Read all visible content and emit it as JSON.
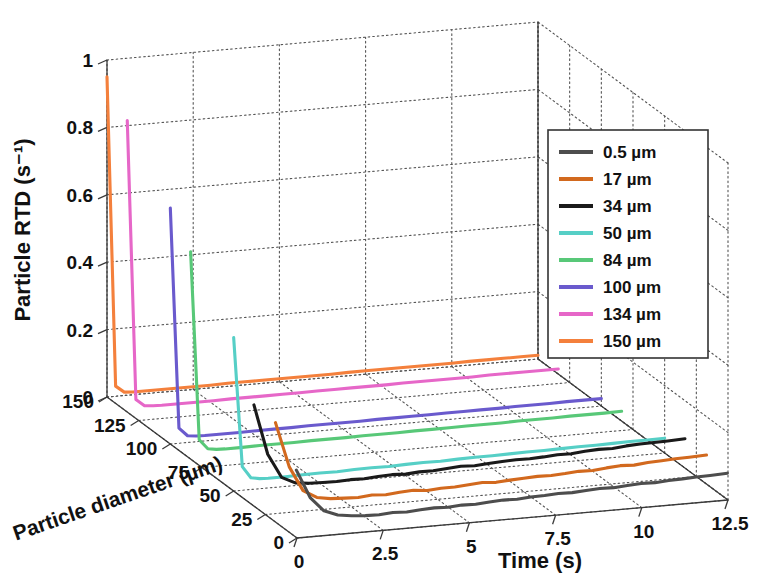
{
  "chart_data": {
    "type": "line",
    "projection": "3d",
    "title": "",
    "xlabel": "Time (s)",
    "ylabel": "Particle diameter (µm)",
    "zlabel": "Particle RTD (s⁻¹)",
    "xlim": [
      0,
      12.5
    ],
    "ylim": [
      0,
      150
    ],
    "zlim": [
      0,
      1
    ],
    "xticks": [
      "0",
      "2.5",
      "5",
      "7.5",
      "10",
      "12.5"
    ],
    "xtick_values": [
      0,
      2.5,
      5,
      7.5,
      10,
      12.5
    ],
    "yticks": [
      "0",
      "25",
      "50",
      "75",
      "100",
      "125",
      "150"
    ],
    "ytick_values": [
      0,
      25,
      50,
      75,
      100,
      125,
      150
    ],
    "zticks": [
      "0",
      "0.2",
      "0.4",
      "0.6",
      "0.8",
      "1"
    ],
    "ztick_values": [
      0,
      0.2,
      0.4,
      0.6,
      0.8,
      1
    ],
    "grid": true,
    "grid_style": "dotted",
    "legend_position": "upper-right",
    "legend_title": "",
    "series": [
      {
        "name": "0.5 µm",
        "diameter": 0.5,
        "color": "#4d4d4d",
        "x": [
          0,
          0.4,
          0.8,
          1.2,
          1.6,
          2,
          2.4,
          2.8,
          3.2,
          3.6,
          4,
          4.4,
          4.8,
          5.2,
          5.6,
          6,
          6.4,
          6.8,
          7.2,
          7.6,
          8,
          8.4,
          8.8,
          9.2,
          9.6,
          10,
          10.4,
          10.8,
          11.2,
          11.6,
          12,
          12.5
        ],
        "values": [
          0.2,
          0.115,
          0.072,
          0.056,
          0.05,
          0.047,
          0.046,
          0.049,
          0.047,
          0.05,
          0.052,
          0.05,
          0.053,
          0.052,
          0.055,
          0.057,
          0.056,
          0.059,
          0.06,
          0.062,
          0.061,
          0.064,
          0.066,
          0.065,
          0.068,
          0.07,
          0.069,
          0.072,
          0.073,
          0.075,
          0.076,
          0.078
        ]
      },
      {
        "name": "17 µm",
        "diameter": 17,
        "color": "#d2691e",
        "x": [
          0,
          0.4,
          0.8,
          1.2,
          1.6,
          2,
          2.4,
          2.8,
          3.2,
          3.6,
          4,
          4.4,
          4.8,
          5.2,
          5.6,
          6,
          6.4,
          6.8,
          7.2,
          7.6,
          8,
          8.4,
          8.8,
          9.2,
          9.6,
          10,
          10.4,
          10.8,
          11.2,
          11.6,
          12,
          12.5
        ],
        "values": [
          0.295,
          0.16,
          0.086,
          0.062,
          0.055,
          0.053,
          0.051,
          0.055,
          0.052,
          0.056,
          0.058,
          0.054,
          0.057,
          0.057,
          0.06,
          0.063,
          0.06,
          0.063,
          0.065,
          0.067,
          0.066,
          0.068,
          0.071,
          0.07,
          0.074,
          0.077,
          0.075,
          0.079,
          0.081,
          0.083,
          0.084,
          0.086
        ]
      },
      {
        "name": "34 µm",
        "diameter": 34,
        "color": "#1a1a1a",
        "x": [
          0,
          0.4,
          0.8,
          1.2,
          1.6,
          2,
          2.4,
          2.8,
          3.2,
          3.6,
          4,
          4.4,
          4.8,
          5.2,
          5.6,
          6,
          6.4,
          6.8,
          7.2,
          7.6,
          8,
          8.4,
          8.8,
          9.2,
          9.6,
          10,
          10.4,
          10.8,
          11.2,
          11.6,
          12,
          12.5
        ],
        "values": [
          0.3,
          0.15,
          0.078,
          0.058,
          0.053,
          0.052,
          0.051,
          0.053,
          0.052,
          0.055,
          0.057,
          0.055,
          0.058,
          0.058,
          0.061,
          0.064,
          0.062,
          0.065,
          0.067,
          0.069,
          0.068,
          0.07,
          0.073,
          0.072,
          0.076,
          0.078,
          0.077,
          0.081,
          0.083,
          0.084,
          0.085,
          0.087
        ]
      },
      {
        "name": "50 µm",
        "diameter": 50,
        "color": "#56cfc6",
        "x": [
          0,
          0.25,
          0.5,
          0.75,
          1,
          1.5,
          2,
          2.5,
          3,
          3.5,
          4,
          4.5,
          5,
          5.5,
          6,
          6.5,
          7,
          7.5,
          8,
          8.5,
          9,
          9.5,
          10,
          10.5,
          11,
          11.5,
          12,
          12.5
        ],
        "values": [
          0.455,
          0.07,
          0.035,
          0.03,
          0.029,
          0.029,
          0.03,
          0.031,
          0.03,
          0.032,
          0.033,
          0.032,
          0.034,
          0.035,
          0.034,
          0.036,
          0.037,
          0.037,
          0.038,
          0.039,
          0.039,
          0.04,
          0.041,
          0.041,
          0.042,
          0.043,
          0.043,
          0.044
        ]
      },
      {
        "name": "84 µm",
        "diameter": 84,
        "color": "#58c878",
        "x": [
          0,
          0.25,
          0.5,
          0.75,
          1,
          1.5,
          2,
          2.5,
          3,
          3.5,
          4,
          4.5,
          5,
          5.5,
          6,
          6.5,
          7,
          7.5,
          8,
          8.5,
          9,
          9.5,
          10,
          10.5,
          11,
          11.5,
          12,
          12.5
        ],
        "values": [
          0.615,
          0.055,
          0.026,
          0.022,
          0.021,
          0.021,
          0.022,
          0.022,
          0.022,
          0.023,
          0.023,
          0.023,
          0.024,
          0.024,
          0.024,
          0.025,
          0.025,
          0.025,
          0.026,
          0.026,
          0.026,
          0.027,
          0.027,
          0.027,
          0.028,
          0.028,
          0.028,
          0.029
        ]
      },
      {
        "name": "100 µm",
        "diameter": 100,
        "color": "#6a5acd",
        "x": [
          0,
          0.25,
          0.5,
          0.75,
          1,
          1.5,
          2,
          2.5,
          3,
          3.5,
          4,
          4.5,
          5,
          5.5,
          6,
          6.5,
          7,
          7.5,
          8,
          8.5,
          9,
          9.5,
          10,
          10.5,
          11,
          11.5,
          12,
          12.5
        ],
        "values": [
          0.7,
          0.045,
          0.02,
          0.017,
          0.016,
          0.016,
          0.016,
          0.017,
          0.017,
          0.017,
          0.018,
          0.018,
          0.018,
          0.018,
          0.019,
          0.019,
          0.019,
          0.019,
          0.02,
          0.02,
          0.02,
          0.02,
          0.021,
          0.021,
          0.021,
          0.022,
          0.022,
          0.022
        ]
      },
      {
        "name": "134 µm",
        "diameter": 134,
        "color": "#e667c8",
        "x": [
          0,
          0.25,
          0.5,
          0.75,
          1,
          1.5,
          2,
          2.5,
          3,
          3.5,
          4,
          4.5,
          5,
          5.5,
          6,
          6.5,
          7,
          7.5,
          8,
          8.5,
          9,
          9.5,
          10,
          10.5,
          11,
          11.5,
          12,
          12.5
        ],
        "values": [
          0.865,
          0.035,
          0.014,
          0.012,
          0.011,
          0.011,
          0.011,
          0.011,
          0.012,
          0.012,
          0.012,
          0.012,
          0.012,
          0.013,
          0.013,
          0.013,
          0.013,
          0.013,
          0.014,
          0.014,
          0.014,
          0.014,
          0.014,
          0.015,
          0.015,
          0.015,
          0.015,
          0.015
        ]
      },
      {
        "name": "150 µm",
        "diameter": 150,
        "color": "#f4803c",
        "x": [
          0,
          0.25,
          0.5,
          0.75,
          1,
          1.5,
          2,
          2.5,
          3,
          3.5,
          4,
          4.5,
          5,
          5.5,
          6,
          6.5,
          7,
          7.5,
          8,
          8.5,
          9,
          9.5,
          10,
          10.5,
          11,
          11.5,
          12,
          12.5
        ],
        "values": [
          0.95,
          0.03,
          0.01,
          0.008,
          0.008,
          0.008,
          0.008,
          0.008,
          0.008,
          0.009,
          0.009,
          0.009,
          0.009,
          0.009,
          0.009,
          0.009,
          0.01,
          0.01,
          0.01,
          0.01,
          0.01,
          0.01,
          0.01,
          0.011,
          0.011,
          0.011,
          0.011,
          0.011
        ]
      }
    ]
  },
  "legend": {
    "items": [
      {
        "label": "0.5 µm",
        "color": "#4d4d4d"
      },
      {
        "label": "17 µm",
        "color": "#d2691e"
      },
      {
        "label": "34 µm",
        "color": "#1a1a1a"
      },
      {
        "label": "50 µm",
        "color": "#56cfc6"
      },
      {
        "label": "84 µm",
        "color": "#58c878"
      },
      {
        "label": "100 µm",
        "color": "#6a5acd"
      },
      {
        "label": "134 µm",
        "color": "#e667c8"
      },
      {
        "label": "150 µm",
        "color": "#f4803c"
      }
    ]
  },
  "style": {
    "axis_color": "#3a3a3a",
    "grid_color": "#555555",
    "background": "#ffffff",
    "legend_border": "#333333"
  }
}
